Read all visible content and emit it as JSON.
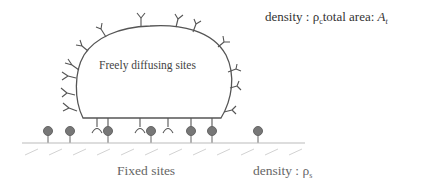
{
  "diagram": {
    "labels": {
      "freely_diffusing": "Freely diffusing sites",
      "top_density_prefix": "density : ",
      "top_density_symbol": "ρ",
      "top_density_sub": "c",
      "top_area_prefix": "total area: ",
      "top_area_symbol": "A",
      "top_area_sub": "t",
      "fixed_sites": "Fixed sites",
      "bottom_density_prefix": "density : ",
      "bottom_density_symbol": "ρ",
      "bottom_density_sub": "s"
    },
    "colors": {
      "outline": "#555555",
      "ball": "#7a7a7a",
      "ground": "#bbbbbb",
      "hatch": "#cccccc"
    }
  }
}
